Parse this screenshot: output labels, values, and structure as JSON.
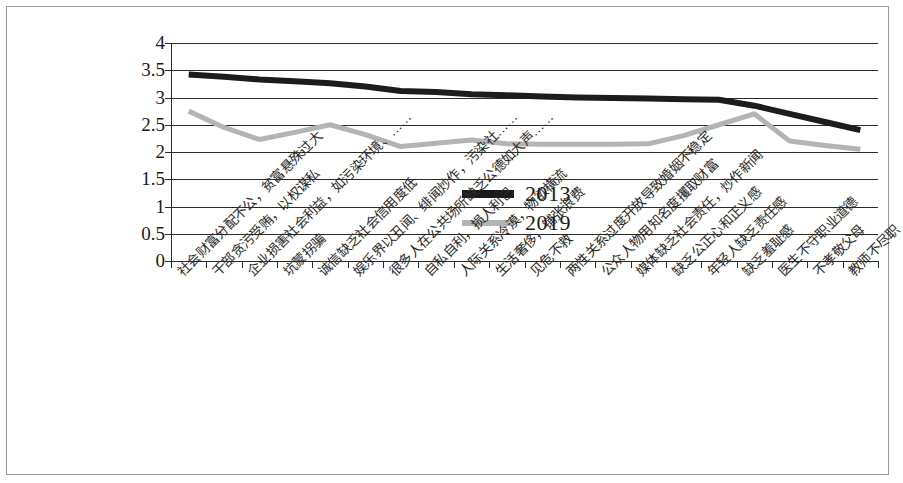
{
  "chart_data": {
    "type": "line",
    "title": "",
    "xlabel": "",
    "ylabel": "",
    "ylim": [
      0,
      4
    ],
    "ytick_values": [
      "4",
      "3.5",
      "3",
      "2.5",
      "2",
      "1.5",
      "1",
      "0.5",
      "0"
    ],
    "grid": true,
    "legend_position": "center",
    "categories": [
      "社会财富分配不公，贫富悬殊过大",
      "干部贪污受贿，以权谋私",
      "企业损害社会利益，如污染环境、……",
      "坑蒙拐骗",
      "诚信缺乏社会信用度低",
      "娱乐界以丑闻、绯闻炒作，污染社……",
      "很多人在公共场所缺乏公德如大声……",
      "自私自利，损人利己",
      "人际关系冷漠，物欲横流",
      "生活奢侈，铺张浪费",
      "见危不救",
      "两性关系过度开放导致婚姻不稳定",
      "公众人物用知名度攫取财富",
      "媒体缺乏社会责任，炒作新闻",
      "缺乏公正心和正义感",
      "年轻人缺乏责任感",
      "缺乏羞耻感",
      "医生不守职业道德",
      "不孝敬父母",
      "教师不尽职"
    ],
    "series": [
      {
        "name": "2013",
        "color": "#1c1c1c",
        "values": [
          3.42,
          3.38,
          3.33,
          3.3,
          3.26,
          3.2,
          3.12,
          3.1,
          3.06,
          3.04,
          3.02,
          3.0,
          2.99,
          2.98,
          2.97,
          2.96,
          2.85,
          2.7,
          2.55,
          2.4
        ]
      },
      {
        "name": "2019",
        "color": "#b4b4b4",
        "values": [
          2.75,
          2.45,
          2.23,
          2.36,
          2.5,
          2.32,
          2.1,
          2.16,
          2.22,
          2.15,
          2.14,
          2.14,
          2.14,
          2.15,
          2.3,
          2.5,
          2.7,
          2.2,
          2.12,
          2.05
        ]
      }
    ]
  },
  "legend": {
    "items": [
      {
        "label": "2013",
        "color": "#1c1c1c"
      },
      {
        "label": "2019",
        "color": "#b4b4b4"
      }
    ]
  }
}
